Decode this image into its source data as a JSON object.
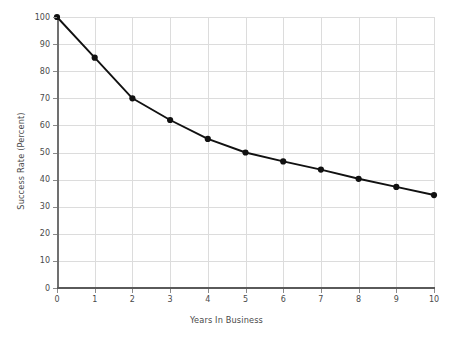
{
  "chart_data": {
    "type": "line",
    "title": "",
    "xlabel": "Years In Business",
    "ylabel": "Success Rate (Percent)",
    "x": [
      0,
      1,
      2,
      3,
      4,
      5,
      6,
      7,
      8,
      9,
      10
    ],
    "values": [
      100,
      85,
      70,
      62,
      55,
      50,
      46.7,
      43.7,
      40.3,
      37.3,
      34.3
    ],
    "series": [
      {
        "name": "Success Rate",
        "values": [
          100,
          85,
          70,
          62,
          55,
          50,
          46.7,
          43.7,
          40.3,
          37.3,
          34.3
        ]
      }
    ],
    "xlim": [
      0,
      10
    ],
    "ylim": [
      0,
      100
    ],
    "xticks": [
      "0",
      "1",
      "2",
      "3",
      "4",
      "5",
      "6",
      "7",
      "8",
      "9",
      "10"
    ],
    "yticks": [
      "0",
      "10",
      "20",
      "30",
      "40",
      "50",
      "60",
      "70",
      "80",
      "90",
      "100"
    ],
    "grid": true,
    "legend": false,
    "marker": "circle",
    "line_color": "#111111",
    "marker_color": "#111111",
    "grid_color": "#dcdcdc",
    "axis_color": "#5a5a5a",
    "text_color": "#4a4a4a",
    "background": "#ffffff"
  }
}
